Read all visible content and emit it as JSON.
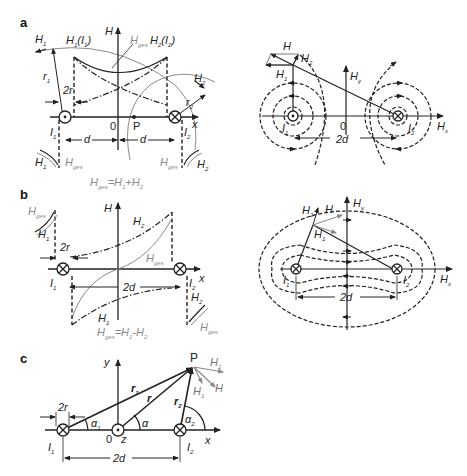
{
  "panels": {
    "a": {
      "label": "a",
      "left": {
        "axis_y": "H",
        "axis_x": "x",
        "origin": "0",
        "point": "P",
        "H1": "H₁",
        "H2": "H₂",
        "H1_I1": "H₁(I₁)",
        "H2_I2": "H₂(I₂)",
        "Hges": "Hges",
        "r1": "r₁",
        "r2": "r₂",
        "two_r": "2r",
        "I1": "I₁",
        "I2": "I₂",
        "d_left": "d",
        "d_right": "d",
        "H1_lower": "H₁",
        "H2_lower": "H₂",
        "Hges_lower_left": "Hges",
        "Hges_lower_right": "Hges",
        "formula": "Hges=H₁+H₂"
      },
      "right": {
        "H": "H",
        "H1": "H₁",
        "H2": "H₂",
        "Hy": "Hy",
        "Hx": "Hx",
        "origin": "0",
        "I1": "I₁",
        "I2": "I₂",
        "distance": "2d"
      }
    },
    "b": {
      "label": "b",
      "left": {
        "axis_y": "H",
        "axis_x": "x",
        "Hges_top_left": "Hges",
        "H1_top": "H₁",
        "H2_top": "H₂",
        "Hges_mid": "Hges",
        "two_r": "2r",
        "I1": "I₁",
        "I2": "I₂",
        "distance": "2d",
        "H1_bottom": "H₁",
        "H2_bottom": "H₂",
        "Hges_bottom_right": "Hges",
        "formula": "Hges=H₁-H₂"
      },
      "right": {
        "H": "H",
        "H1": "H₁",
        "H2": "H₂",
        "Hy": "Hy",
        "Hx": "Hx",
        "I1": "I₁",
        "I2": "I₂",
        "distance": "2d"
      }
    },
    "c": {
      "label": "c",
      "axis_y": "y",
      "axis_x": "x",
      "axis_z": "z",
      "origin": "0",
      "point": "P",
      "H": "H",
      "H1": "H₁",
      "H2": "H₂",
      "r": "r",
      "r1": "r₁",
      "r2": "r₂",
      "alpha": "α",
      "alpha1": "α₁",
      "alpha2": "α₂",
      "two_r": "2r",
      "I1": "I₁",
      "I2": "I₂",
      "distance": "2d"
    }
  },
  "colors": {
    "ink": "#222222",
    "gray": "#8a8a8a",
    "background": "#ffffff"
  }
}
